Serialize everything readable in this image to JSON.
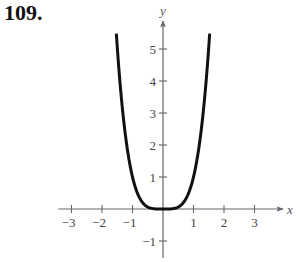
{
  "problem": {
    "number": "109."
  },
  "chart_data": {
    "type": "line",
    "title": "",
    "function": "y = x^4",
    "xlabel": "x",
    "ylabel": "y",
    "xlim": [
      -3.5,
      3.8
    ],
    "ylim": [
      -1.5,
      5.9
    ],
    "x_ticks": [
      -3,
      -2,
      -1,
      1,
      2,
      3
    ],
    "x_tick_labels": [
      "−3",
      "−2",
      "−1",
      "1",
      "2",
      "3"
    ],
    "y_ticks": [
      -1,
      1,
      2,
      3,
      4,
      5
    ],
    "y_tick_labels": [
      "−1",
      "1",
      "2",
      "3",
      "4",
      "5"
    ],
    "grid": false,
    "legend": null,
    "series": [
      {
        "name": "y = x^4",
        "x": [
          -1.53,
          -1.4,
          -1.2,
          -1.0,
          -0.8,
          -0.6,
          -0.4,
          -0.2,
          0,
          0.2,
          0.4,
          0.6,
          0.8,
          1.0,
          1.2,
          1.4,
          1.53
        ],
        "y": [
          5.48,
          3.84,
          2.07,
          1.0,
          0.41,
          0.13,
          0.03,
          0.0,
          0,
          0.0,
          0.03,
          0.13,
          0.41,
          1.0,
          2.07,
          3.84,
          5.48
        ]
      }
    ],
    "colors": {
      "curve": "#111111",
      "axis": "#666666",
      "text": "#444444"
    }
  }
}
